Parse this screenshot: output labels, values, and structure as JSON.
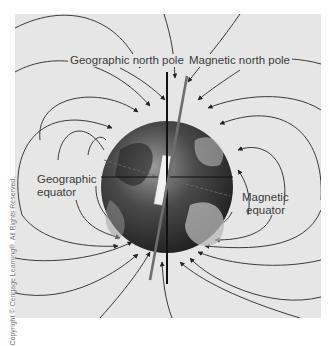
{
  "diagram": {
    "type": "earth-magnetic-field",
    "labels": {
      "geographic_north_pole": "Geographic north pole",
      "magnetic_north_pole": "Magnetic north pole",
      "geographic_equator_line1": "Geographic",
      "geographic_equator_line2": "equator",
      "magnetic_equator_line1": "Magnetic",
      "magnetic_equator_line2": "equator"
    },
    "copyright": "Copyright © Cengage Learning®. All Rights Reserved.",
    "colors": {
      "background": "#e6e6e6",
      "field_line": "#3a3a3a",
      "geographic_axis": "#111111",
      "magnetic_axis": "#6e6e6e",
      "text": "#3a3a3a"
    }
  }
}
